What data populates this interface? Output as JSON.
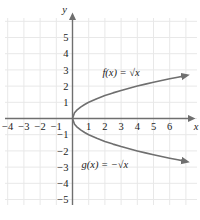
{
  "chart_data": {
    "type": "line",
    "title": "",
    "xlabel": "x",
    "ylabel": "y",
    "xlim": [
      -5,
      7
    ],
    "ylim": [
      -6,
      6
    ],
    "grid": true,
    "grid_color": "#e8e8e8",
    "axis_color": "#6f6f6f",
    "curve_color": "#6f6f6f",
    "legend_position": "inline-annotation",
    "xticks": [
      "-4",
      "-3",
      "-2",
      "-1",
      "1",
      "2",
      "3",
      "4",
      "5",
      "6"
    ],
    "xtick_values": [
      -4,
      -3,
      -2,
      -1,
      1,
      2,
      3,
      4,
      5,
      6
    ],
    "yticks": [
      "5",
      "4",
      "3",
      "2",
      "1",
      "-1",
      "-2",
      "-3",
      "-4",
      "-5"
    ],
    "ytick_values": [
      5,
      4,
      3,
      2,
      1,
      -1,
      -2,
      -3,
      -4,
      -5
    ],
    "series": [
      {
        "name": "f(x) = √x",
        "label": "f(x) = √x",
        "label_x": 3.0,
        "label_y": 2.85,
        "arrow_end": true,
        "x": [
          0,
          0.125,
          0.25,
          0.5,
          0.75,
          1,
          1.5,
          2,
          2.5,
          3,
          3.5,
          4,
          4.5,
          5,
          5.5,
          6,
          6.5,
          7
        ],
        "y": [
          0,
          0.354,
          0.5,
          0.707,
          0.866,
          1,
          1.225,
          1.414,
          1.581,
          1.732,
          1.871,
          2,
          2.121,
          2.236,
          2.345,
          2.449,
          2.55,
          2.646
        ]
      },
      {
        "name": "g(x) = -√x",
        "label": "g(x) = −√x",
        "label_x": 2.0,
        "label_y": -2.85,
        "arrow_end": true,
        "x": [
          0,
          0.125,
          0.25,
          0.5,
          0.75,
          1,
          1.5,
          2,
          2.5,
          3,
          3.5,
          4,
          4.5,
          5,
          5.5,
          6,
          6.5,
          7
        ],
        "y": [
          0,
          -0.354,
          -0.5,
          -0.707,
          -0.866,
          -1,
          -1.225,
          -1.414,
          -1.581,
          -1.732,
          -1.871,
          -2,
          -2.121,
          -2.236,
          -2.345,
          -2.449,
          -2.55,
          -2.646
        ]
      }
    ]
  },
  "axes": {
    "y_axis_name": "y",
    "x_axis_name": "x"
  },
  "labels": {
    "f_label": "f(x) = √x",
    "g_label": "g(x) = −√x"
  }
}
